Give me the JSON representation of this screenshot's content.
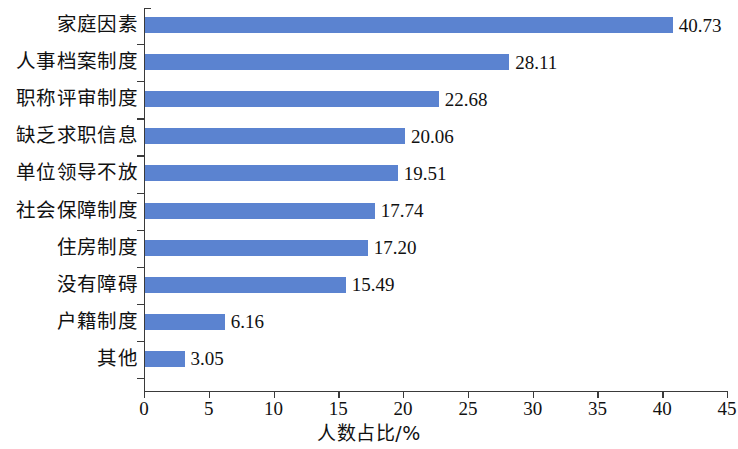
{
  "chart_data": {
    "type": "bar",
    "orientation": "horizontal",
    "title": "",
    "xlabel": "人数占比/%",
    "ylabel": "",
    "xlim": [
      0,
      45
    ],
    "xticks": [
      "0",
      "5",
      "10",
      "15",
      "20",
      "25",
      "30",
      "35",
      "40",
      "45"
    ],
    "xtick_values": [
      0,
      5,
      10,
      15,
      20,
      25,
      30,
      35,
      40,
      45
    ],
    "grid": false,
    "legend": false,
    "bar_color": "#5b83d0",
    "axis_color": "#3a3a3a",
    "categories": [
      "家庭因素",
      "人事档案制度",
      "职称评审制度",
      "缺乏求职信息",
      "单位领导不放",
      "社会保障制度",
      "住房制度",
      "没有障碍",
      "户籍制度",
      "其他"
    ],
    "values": [
      40.73,
      28.11,
      22.68,
      20.06,
      19.51,
      17.74,
      17.2,
      15.49,
      6.16,
      3.05
    ],
    "value_labels": [
      "40.73",
      "28.11",
      "22.68",
      "20.06",
      "19.51",
      "17.74",
      "17.20",
      "15.49",
      "6.16",
      "3.05"
    ]
  }
}
